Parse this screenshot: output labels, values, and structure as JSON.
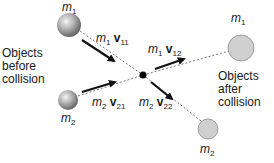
{
  "diagram": {
    "colors": {
      "sphere_light": "#e6e6e6",
      "sphere_dark": "#6e6e6e",
      "after_fill": "#cfcfcf",
      "after_stroke": "#8a8a8a",
      "line": "#555555",
      "arrow": "#111111"
    },
    "captions": {
      "before": [
        "Objects",
        "before",
        "collision"
      ],
      "after": [
        "Objects",
        "after",
        "collision"
      ]
    },
    "masses": {
      "m1_before": {
        "symbol": "m",
        "sub": "1"
      },
      "m2_before": {
        "symbol": "m",
        "sub": "2"
      },
      "m1_after": {
        "symbol": "m",
        "sub": "1"
      },
      "m2_after": {
        "symbol": "m",
        "sub": "2"
      }
    },
    "momenta": {
      "m1v11": {
        "mass": "m",
        "mass_sub": "1",
        "vec": "v",
        "vec_sub": "11"
      },
      "m2v21": {
        "mass": "m",
        "mass_sub": "2",
        "vec": "v",
        "vec_sub": "21"
      },
      "m1v12": {
        "mass": "m",
        "mass_sub": "1",
        "vec": "v",
        "vec_sub": "12"
      },
      "m2v22": {
        "mass": "m",
        "mass_sub": "2",
        "vec": "v",
        "vec_sub": "22"
      }
    }
  }
}
